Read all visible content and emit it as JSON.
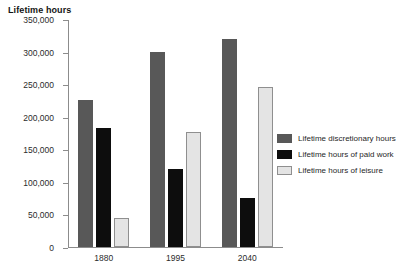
{
  "chart_data": {
    "type": "bar",
    "title": "",
    "xlabel": "",
    "ylabel": "Lifetime hours",
    "categories": [
      "1880",
      "1995",
      "2040"
    ],
    "series": [
      {
        "name": "Lifetime discretionary hours",
        "color": "#585858",
        "values": [
          225000,
          300000,
          320000
        ]
      },
      {
        "name": "Lifetime hours of paid work",
        "color": "#0d0d0d",
        "values": [
          182000,
          120000,
          75000
        ]
      },
      {
        "name": "Lifetime hours of leisure",
        "color": "#e4e4e4",
        "values": [
          45000,
          176000,
          245000
        ]
      }
    ],
    "ylim": [
      0,
      350000
    ],
    "ytick_values": [
      0,
      50000,
      100000,
      150000,
      200000,
      250000,
      300000,
      350000
    ],
    "ytick_labels": [
      "0",
      "50,000",
      "100,000",
      "150,000",
      "200,000",
      "250,000",
      "300,000",
      "350,000"
    ],
    "grid": false,
    "legend_position": "right"
  },
  "axis": {
    "y_title": "Lifetime hours"
  }
}
